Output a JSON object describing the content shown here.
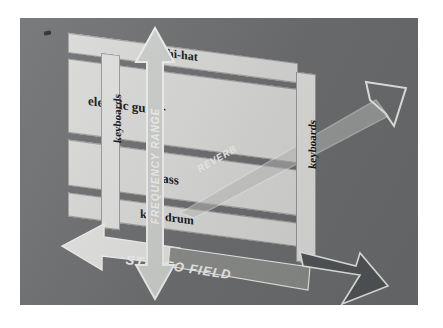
{
  "figure": {
    "background_color": "#6f7173",
    "panel_color": "#6f7173",
    "slab_color": "#d9dad8",
    "bar_color": "#e2e3e0",
    "arrow_light_color": "#e8e9e6",
    "arrow_dark_color": "#5b5d5e",
    "text_color": "#16181a"
  },
  "axes": {
    "vertical": {
      "label": "FREQUENCY RANGE",
      "direction": "double",
      "orientation": "vertical",
      "style": "light"
    },
    "horizontal": {
      "label": "STEREO FIELD",
      "direction": "double",
      "orientation": "diagonal-down-right",
      "style": "light-left-dark-right"
    },
    "depth": {
      "label": "REVERB",
      "direction": "single",
      "orientation": "diagonal-up-right",
      "style": "outline"
    }
  },
  "bands": [
    {
      "label": "hi-hat",
      "tone": "lite"
    },
    {
      "label": "electric guitar",
      "tone": "lite"
    },
    {
      "label": "bass",
      "tone": "lite"
    },
    {
      "label": "kick drum",
      "tone": "lite"
    }
  ],
  "side_bars": [
    {
      "label": "keyboards",
      "side": "left"
    },
    {
      "label": "keyboards",
      "side": "right"
    }
  ]
}
